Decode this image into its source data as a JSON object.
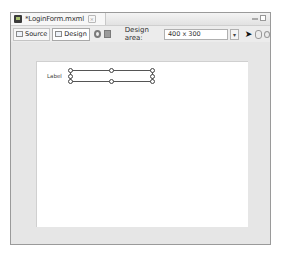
{
  "editor": {
    "tab": {
      "title": "*LoginForm.mxml",
      "icon": "mxml-file-icon",
      "close_icon": "close-icon"
    },
    "window_controls": [
      "minimize-icon",
      "maximize-icon"
    ]
  },
  "toolbar": {
    "source_label": "Source",
    "design_label": "Design",
    "design_area_label": "Design area:",
    "design_area_value": "400 x 300",
    "dropdown_glyph": "▾",
    "select_tool_glyph": "➤"
  },
  "canvas": {
    "label_component_text": "Label",
    "textinput_value": ""
  },
  "colors": {
    "frame_bg": "#e6e6e6",
    "canvas_bg": "#ffffff",
    "selection_border": "#555555"
  }
}
